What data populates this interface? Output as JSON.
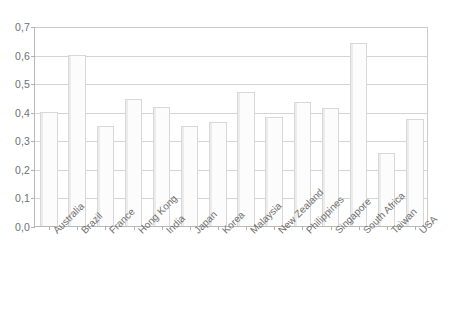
{
  "chart_data": {
    "type": "bar",
    "title": "",
    "subtitle": "",
    "xlabel": "",
    "ylabel": "",
    "categories": [
      "Australia",
      "Brazil",
      "France",
      "Hong Kong",
      "India",
      "Japan",
      "Korea",
      "Malaysia",
      "New Zealand",
      "Philippines",
      "Singapore",
      "South Africa",
      "Taiwan",
      "USA"
    ],
    "values": [
      0.4,
      0.6,
      0.35,
      0.445,
      0.418,
      0.35,
      0.363,
      0.47,
      0.383,
      0.433,
      0.413,
      0.64,
      0.255,
      0.375
    ],
    "ylim": [
      0.0,
      0.7
    ],
    "ytick_values": [
      0.0,
      0.1,
      0.2,
      0.3,
      0.4,
      0.5,
      0.6,
      0.7
    ],
    "ytick_labels": [
      "0,0",
      "0,1",
      "0,2",
      "0,3",
      "0,4",
      "0,5",
      "0,6",
      "0,7"
    ],
    "decimal_separator": ",",
    "grid": true,
    "grid_axis": "y",
    "legend": false,
    "legend_position": "none",
    "annotations": [],
    "style": {
      "bar_fill": "#fcfcfc",
      "bar_border": "#d8d8d8",
      "gridline_color": "#d4d4d4",
      "axis_color": "#b9b9b9",
      "background": "#ffffff",
      "tick_label_color": "#6f6f6f",
      "xtick_label_rotation_deg": -45
    }
  }
}
